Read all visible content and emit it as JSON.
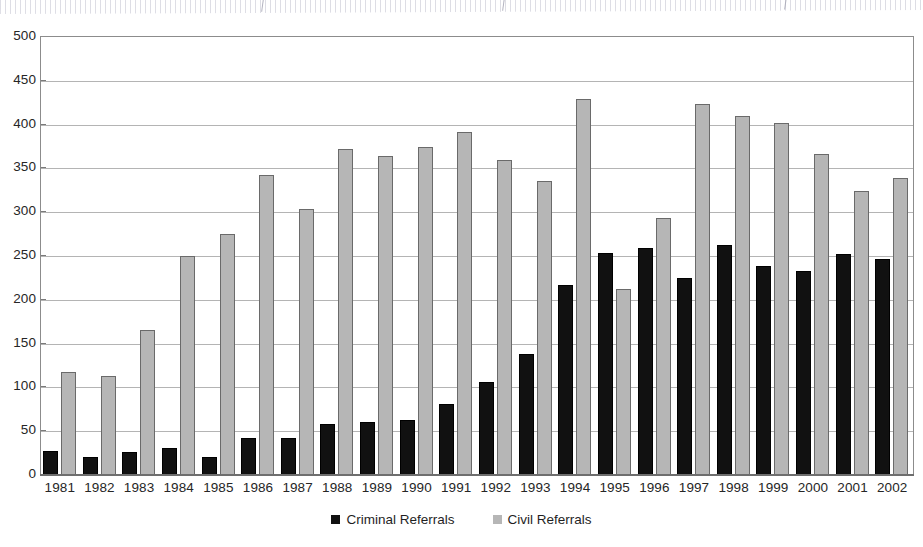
{
  "chart_data": {
    "type": "bar",
    "title": "",
    "subtitle": "",
    "xlabel": "",
    "ylabel": "",
    "ylim": [
      0,
      500
    ],
    "ytick_step": 50,
    "yticks": [
      500,
      450,
      400,
      350,
      300,
      250,
      200,
      150,
      100,
      50,
      0
    ],
    "grid": true,
    "legend_position": "bottom-center",
    "categories": [
      "1981",
      "1982",
      "1983",
      "1984",
      "1985",
      "1986",
      "1987",
      "1988",
      "1989",
      "1990",
      "1991",
      "1992",
      "1993",
      "1994",
      "1995",
      "1996",
      "1997",
      "1998",
      "1999",
      "2000",
      "2001",
      "2002"
    ],
    "series": [
      {
        "name": "Criminal Referrals",
        "color": "#111111",
        "values": [
          27,
          21,
          26,
          31,
          20,
          42,
          42,
          58,
          60,
          63,
          81,
          106,
          138,
          217,
          253,
          259,
          225,
          263,
          239,
          233,
          252,
          247
        ]
      },
      {
        "name": "Civil Referrals",
        "color": "#b6b6b6",
        "values": [
          118,
          113,
          165,
          250,
          275,
          342,
          304,
          372,
          364,
          375,
          392,
          360,
          336,
          429,
          212,
          293,
          424,
          410,
          402,
          366,
          324,
          339
        ]
      }
    ]
  },
  "legend": {
    "entries": [
      {
        "label": "Criminal Referrals",
        "swatch": "criminal"
      },
      {
        "label": "Civil Referrals",
        "swatch": "civil"
      }
    ]
  }
}
